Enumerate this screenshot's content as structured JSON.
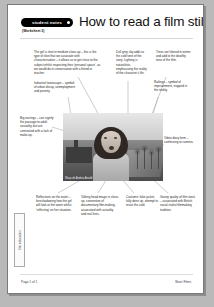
{
  "document": {
    "badge_label": "student notes",
    "worksheet_number": "(Worksheet 3)",
    "title": "How to read a film still",
    "side_tab_label": "film education",
    "page_number": "Page 1 of 1",
    "footer_right": "Short Films"
  },
  "photo": {
    "caption": "Wasp dir Andrea Arnold",
    "alt_description": "Black and white film still of a girl in medium close-up, mouth open, with bare winter trees, a path and industrial buildings behind her"
  },
  "annotations": [
    {
      "id": "girl-close-up",
      "text": "The girl is shot in medium close-up – this is the type of shot that we associate with characterisation – it allows us to get close to the subject whilst respecting their 'personal space', as we would do in conversation with a friend or teacher."
    },
    {
      "id": "grey-sky",
      "text": "Dull grey sky adds to the cold tone of the story. Lighting is naturalistic, emphasising the reality of the character's life."
    },
    {
      "id": "bare-trees",
      "text": "Trees are littered in winter and add to the deathly tone of the film."
    },
    {
      "id": "industrial-townscape",
      "text": "Industrial townscape – symbol of urban decay, unemployment and poverty."
    },
    {
      "id": "railings",
      "text": "Railings – symbol of imprisonment, trapped in the reality."
    },
    {
      "id": "big-earrings",
      "text": "Big earrings – can signify the passage to adult sexuality, but are contrasted with a lack of make-up."
    },
    {
      "id": "video-diary",
      "text": "Video diary form – confessing to camera."
    },
    {
      "id": "reflections-water",
      "text": "Reflections on the water – foreshadowing how the girl will look at the water whilst 'reflecting' on her situation."
    },
    {
      "id": "talking-head",
      "text": "Talking head image in close-up, convention of documentary film-making, associated with actuality and real lives."
    },
    {
      "id": "costume",
      "text": "Costume: fake jacket, fully done up, attempt to resist the cold."
    },
    {
      "id": "grainy-film-stock",
      "text": "Grainy quality of film stock – associated with British social realist filmmaking tradition."
    }
  ],
  "colors": {
    "page_background": "#b9b9b9",
    "sheet": "#ffffff",
    "badge": "#000000",
    "leader_line": "#9a9a9a",
    "text": "#2a2a2a"
  }
}
